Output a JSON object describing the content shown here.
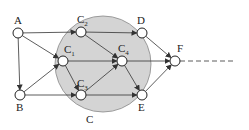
{
  "diagram": {
    "type": "network-graph",
    "region": {
      "label": "C",
      "cx": 103,
      "cy": 64,
      "r": 48,
      "fill": "#d4d4d4",
      "stroke": "#888888",
      "label_x": 86,
      "label_y": 123
    },
    "nodes": [
      {
        "id": "A",
        "label": "A",
        "sub": "",
        "x": 18,
        "y": 33,
        "lx": 14,
        "ly": 24
      },
      {
        "id": "B",
        "label": "B",
        "sub": "",
        "x": 20,
        "y": 95,
        "lx": 16,
        "ly": 111
      },
      {
        "id": "C1",
        "label": "C",
        "sub": "1",
        "x": 63,
        "y": 61,
        "lx": 64,
        "ly": 53
      },
      {
        "id": "C2",
        "label": "C",
        "sub": "2",
        "x": 81,
        "y": 32,
        "lx": 77,
        "ly": 23
      },
      {
        "id": "C3",
        "label": "C",
        "sub": "3",
        "x": 81,
        "y": 95,
        "lx": 77,
        "ly": 87
      },
      {
        "id": "C4",
        "label": "C",
        "sub": "4",
        "x": 122,
        "y": 61,
        "lx": 118,
        "ly": 52
      },
      {
        "id": "D",
        "label": "D",
        "sub": "",
        "x": 142,
        "y": 33,
        "lx": 137,
        "ly": 24
      },
      {
        "id": "E",
        "label": "E",
        "sub": "",
        "x": 142,
        "y": 95,
        "lx": 138,
        "ly": 111
      },
      {
        "id": "F",
        "label": "F",
        "sub": "",
        "x": 175,
        "y": 61,
        "lx": 177,
        "ly": 52
      }
    ],
    "edges": [
      {
        "from": "A",
        "to": "B"
      },
      {
        "from": "A",
        "to": "C2"
      },
      {
        "from": "A",
        "to": "C1"
      },
      {
        "from": "B",
        "to": "C1"
      },
      {
        "from": "B",
        "to": "C3"
      },
      {
        "from": "C2",
        "to": "D"
      },
      {
        "from": "C2",
        "to": "C4"
      },
      {
        "from": "C1",
        "to": "C4"
      },
      {
        "from": "C1",
        "to": "C3"
      },
      {
        "from": "C3",
        "to": "C4"
      },
      {
        "from": "C3",
        "to": "E"
      },
      {
        "from": "C4",
        "to": "E"
      },
      {
        "from": "C4",
        "to": "F"
      },
      {
        "from": "D",
        "to": "F"
      },
      {
        "from": "E",
        "to": "F"
      }
    ],
    "continuation": {
      "from": "F",
      "x2": 236,
      "y": 61,
      "style": "dashed"
    },
    "node_radius": 5,
    "edge_color": "#333333"
  }
}
